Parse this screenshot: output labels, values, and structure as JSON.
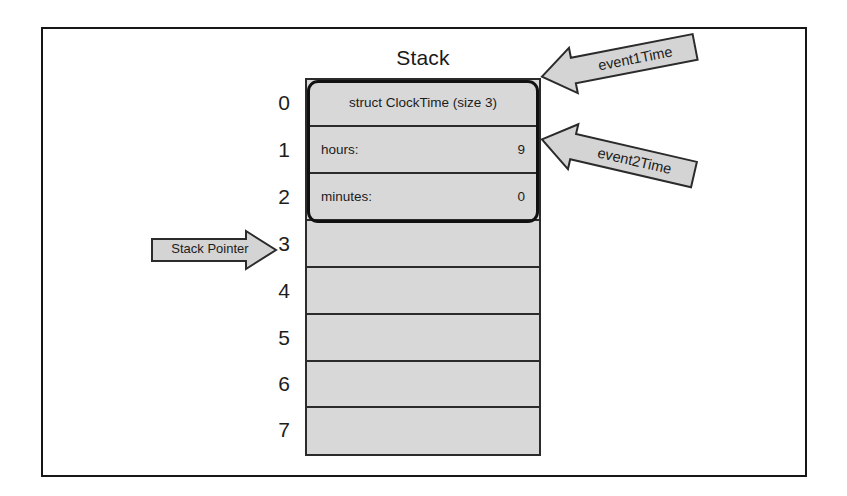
{
  "diagram": {
    "title": "Stack",
    "stack": {
      "rows": [
        {
          "index": "0",
          "label": "struct ClockTime (size 3)",
          "value": "",
          "centered": true
        },
        {
          "index": "1",
          "label": "hours:",
          "value": "9",
          "centered": false
        },
        {
          "index": "2",
          "label": "minutes:",
          "value": "0",
          "centered": false
        },
        {
          "index": "3",
          "label": "",
          "value": "",
          "centered": false
        },
        {
          "index": "4",
          "label": "",
          "value": "",
          "centered": false
        },
        {
          "index": "5",
          "label": "",
          "value": "",
          "centered": false
        },
        {
          "index": "6",
          "label": "",
          "value": "",
          "centered": false
        },
        {
          "index": "7",
          "label": "",
          "value": "",
          "centered": false
        }
      ]
    },
    "stack_pointer": {
      "label": "Stack Pointer",
      "points_to_row": "3"
    },
    "callouts": [
      {
        "label": "event1Time",
        "points_to_row": "0"
      },
      {
        "label": "event2Time",
        "points_to_row": "0"
      }
    ],
    "colors": {
      "cell_fill": "#d8d8d8",
      "arrow_fill": "#d4d4d4",
      "border": "#2b2b2b",
      "frame": "#161616",
      "text": "#1c1c1c"
    }
  }
}
